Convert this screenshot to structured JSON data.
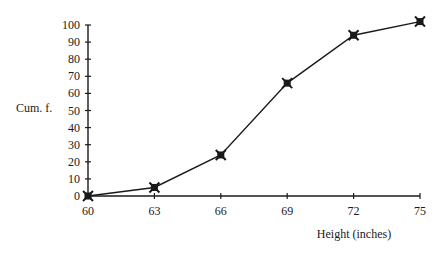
{
  "chart_data": {
    "type": "line",
    "title": "",
    "xlabel": "Height (inches)",
    "ylabel": "Cum. f.",
    "x": [
      60,
      63,
      66,
      69,
      72,
      75
    ],
    "series": [
      {
        "name": "Cumulative frequency",
        "values": [
          0,
          5,
          24,
          66,
          94,
          102
        ]
      }
    ],
    "x_ticks": [
      "60",
      "63",
      "66",
      "69",
      "72",
      "75"
    ],
    "y_ticks": [
      "0",
      "10",
      "20",
      "30",
      "40",
      "50",
      "60",
      "70",
      "80",
      "90",
      "100"
    ],
    "xlim": [
      60,
      75
    ],
    "ylim": [
      0,
      100
    ],
    "grid": false,
    "legend": "none",
    "marker": "x-filled-square",
    "line_color": "#1a1a1a"
  }
}
